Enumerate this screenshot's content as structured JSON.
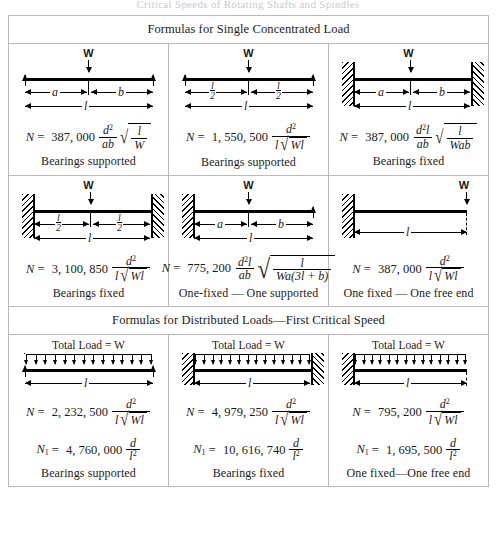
{
  "page": {
    "top_partial_text": "Critical Speeds of Rotating Shafts and Spindles",
    "sections": [
      {
        "id": "single",
        "heading": "Formulas for Single Concentrated Load",
        "cells": [
          {
            "id": "c1",
            "support_type": "simply-supported",
            "load_label": "W",
            "dim_left": "a",
            "dim_right": "b",
            "dim_span": "l",
            "equations": [
              {
                "lhs": "N",
                "coef": "387, 000",
                "num": "d",
                "num_sup": "2",
                "den": "ab",
                "radical": {
                  "num": "l",
                  "den": "W"
                }
              }
            ],
            "caption": "Bearings supported"
          },
          {
            "id": "c2",
            "support_type": "simply-supported",
            "load_label": "W",
            "dim_left_num": "l",
            "dim_left_den": "2",
            "dim_right_num": "l",
            "dim_right_den": "2",
            "dim_span": "l",
            "equations": [
              {
                "lhs": "N",
                "coef": "1, 550, 500",
                "num": "d",
                "num_sup": "2",
                "den_pre": "l",
                "den_radical": "Wl"
              }
            ],
            "caption": "Bearings supported"
          },
          {
            "id": "c3",
            "support_type": "both-fixed",
            "load_label": "W",
            "dim_left": "a",
            "dim_right": "b",
            "dim_span": "l",
            "equations": [
              {
                "lhs": "N",
                "coef": "387, 000",
                "num": "d",
                "num_sup": "2",
                "num_post": "l",
                "den": "ab",
                "radical": {
                  "num": "l",
                  "den": "Wab"
                }
              }
            ],
            "caption": "Bearings fixed"
          },
          {
            "id": "c4",
            "support_type": "both-fixed",
            "load_label": "W",
            "dim_left_num": "l",
            "dim_left_den": "2",
            "dim_right_num": "l",
            "dim_right_den": "2",
            "dim_span": "l",
            "equations": [
              {
                "lhs": "N",
                "coef": "3, 100, 850",
                "num": "d",
                "num_sup": "2",
                "den_pre": "l",
                "den_radical": "Wl"
              }
            ],
            "caption": "Bearings fixed"
          },
          {
            "id": "c5",
            "support_type": "left-fixed-right-supported",
            "load_label": "W",
            "dim_left": "a",
            "dim_right": "b",
            "dim_span": "l",
            "equations": [
              {
                "lhs": "N",
                "coef": "775, 200",
                "num": "d",
                "num_sup": "2",
                "num_post": "l",
                "den": "ab",
                "radical": {
                  "num": "l",
                  "den": "Wa(3l + b)"
                }
              }
            ],
            "caption": "One-fixed — One supported"
          },
          {
            "id": "c6",
            "support_type": "cantilever",
            "load_label": "W",
            "dim_span": "l",
            "equations": [
              {
                "lhs": "N",
                "coef": "387, 000",
                "num": "d",
                "num_sup": "2",
                "den_pre": "l",
                "den_radical": "Wl"
              }
            ],
            "caption": "One fixed — One free end"
          }
        ]
      },
      {
        "id": "distributed",
        "heading": "Formulas for Distributed Loads—First Critical Speed",
        "cells": [
          {
            "id": "c7",
            "support_type": "simply-supported",
            "load_label": "Total Load = W",
            "arrow_count": 14,
            "dim_span": "l",
            "equations": [
              {
                "lhs": "N",
                "coef": "2, 232, 500",
                "num": "d",
                "num_sup": "2",
                "den_pre": "l",
                "den_radical": "Wl"
              },
              {
                "lhs": "N",
                "lhs_sub": "1",
                "coef": "4, 760, 000",
                "num": "d",
                "den": "l",
                "den_sup": "2"
              }
            ],
            "caption": "Bearings supported"
          },
          {
            "id": "c8",
            "support_type": "both-fixed",
            "load_label": "Total Load = W",
            "arrow_count": 14,
            "dim_span": "l",
            "equations": [
              {
                "lhs": "N",
                "coef": "4, 979, 250",
                "num": "d",
                "num_sup": "2",
                "den_pre": "l",
                "den_radical": "Wl"
              },
              {
                "lhs": "N",
                "lhs_sub": "1",
                "coef": "10, 616, 740",
                "num": "d",
                "den": "l",
                "den_sup": "2"
              }
            ],
            "caption": "Bearings fixed"
          },
          {
            "id": "c9",
            "support_type": "cantilever",
            "load_label": "Total Load = W",
            "arrow_count": 14,
            "dim_span": "l",
            "equations": [
              {
                "lhs": "N",
                "coef": "795, 200",
                "num": "d",
                "num_sup": "2",
                "den_pre": "l",
                "den_radical": "Wl"
              },
              {
                "lhs": "N",
                "lhs_sub": "1",
                "coef": "1, 695, 500",
                "num": "d",
                "den": "l",
                "den_sup": "2"
              }
            ],
            "caption": "One fixed—One free end"
          }
        ]
      }
    ]
  }
}
